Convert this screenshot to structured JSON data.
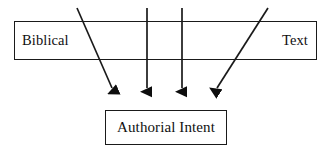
{
  "diagram": {
    "type": "flow-diagram",
    "background_color": "#ffffff",
    "stroke_color": "#1a1a1a",
    "text_color": "#101010",
    "source_box": {
      "left_label": "Biblical",
      "right_label": "Text"
    },
    "target_box": {
      "label": "Authorial Intent"
    },
    "arrows": [
      {
        "name": "arrow-diagonal-left",
        "x1": 77,
        "y1": 8,
        "x2": 112,
        "y2": 88
      },
      {
        "name": "arrow-vertical-inner-left",
        "x1": 147,
        "y1": 8,
        "x2": 147,
        "y2": 88
      },
      {
        "name": "arrow-vertical-inner-right",
        "x1": 182,
        "y1": 8,
        "x2": 182,
        "y2": 88
      },
      {
        "name": "arrow-diagonal-right",
        "x1": 268,
        "y1": 8,
        "x2": 217,
        "y2": 88
      }
    ]
  }
}
